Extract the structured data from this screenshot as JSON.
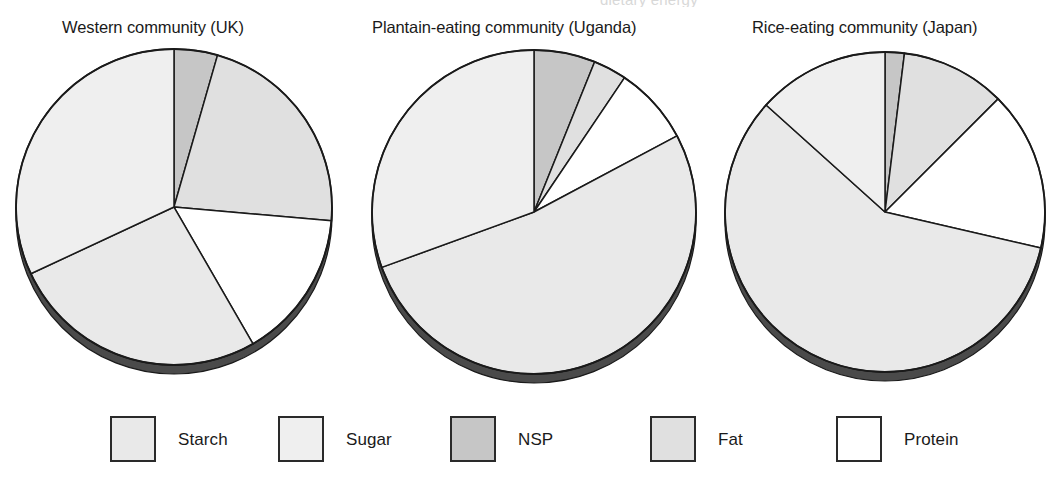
{
  "header": {
    "clipped_text": "dietary energy"
  },
  "legend": {
    "position": "bottom",
    "items": [
      {
        "label": "Starch",
        "color": "#e9e9e9",
        "name": "starch"
      },
      {
        "label": "Sugar",
        "color": "#efefef",
        "name": "sugar"
      },
      {
        "label": "NSP",
        "color": "#c6c6c6",
        "name": "nsp"
      },
      {
        "label": "Fat",
        "color": "#e0e0e0",
        "name": "fat"
      },
      {
        "label": "Protein",
        "color": "#ffffff",
        "name": "protein"
      }
    ]
  },
  "charts": [
    {
      "title": "Western community (UK)"
    },
    {
      "title": "Plantain-eating community (Uganda)"
    },
    {
      "title": "Rice-eating community (Japan)"
    }
  ],
  "chart_data": [
    {
      "type": "pie",
      "title": "Western community (UK)",
      "labels": [
        "NSP",
        "Fat",
        "Protein",
        "Starch",
        "Sugar"
      ],
      "values": [
        4.4,
        22.0,
        15.3,
        26.4,
        31.9
      ],
      "unit": "percent of dietary energy",
      "start_angle_deg": 0,
      "direction": "clockwise",
      "colors": [
        "#c6c6c6",
        "#e0e0e0",
        "#ffffff",
        "#e9e9e9",
        "#efefef"
      ],
      "boundaries_deg": [
        0,
        16,
        95,
        150,
        245,
        360
      ],
      "legend": [
        "Starch",
        "Sugar",
        "NSP",
        "Fat",
        "Protein"
      ]
    },
    {
      "type": "pie",
      "title": "Plantain-eating community (Uganda)",
      "labels": [
        "NSP",
        "Fat",
        "Protein",
        "Starch",
        "Sugar"
      ],
      "values": [
        6.1,
        3.3,
        7.8,
        52.2,
        30.6
      ],
      "unit": "percent of dietary energy",
      "start_angle_deg": 0,
      "direction": "clockwise",
      "colors": [
        "#c6c6c6",
        "#e0e0e0",
        "#ffffff",
        "#e9e9e9",
        "#efefef"
      ],
      "boundaries_deg": [
        0,
        22,
        34,
        62,
        250,
        360
      ],
      "legend": [
        "Starch",
        "Sugar",
        "NSP",
        "Fat",
        "Protein"
      ]
    },
    {
      "type": "pie",
      "title": "Rice-eating community (Japan)",
      "labels": [
        "NSP",
        "Fat",
        "Protein",
        "Starch",
        "Sugar"
      ],
      "values": [
        1.9,
        10.6,
        16.1,
        58.1,
        13.3
      ],
      "unit": "percent of dietary energy",
      "start_angle_deg": 0,
      "direction": "clockwise",
      "colors": [
        "#c6c6c6",
        "#e0e0e0",
        "#ffffff",
        "#e9e9e9",
        "#efefef"
      ],
      "boundaries_deg": [
        0,
        7,
        45,
        103,
        312,
        360
      ],
      "legend": [
        "Starch",
        "Sugar",
        "NSP",
        "Fat",
        "Protein"
      ]
    }
  ],
  "geometry": {
    "pies": [
      {
        "cx": 174,
        "cy": 207,
        "r": 158
      },
      {
        "cx": 534,
        "cy": 212,
        "r": 162
      },
      {
        "cx": 885,
        "cy": 212,
        "r": 160
      }
    ],
    "shadow_color": "#4a4a4a",
    "stroke_color": "#1a1a1a"
  }
}
